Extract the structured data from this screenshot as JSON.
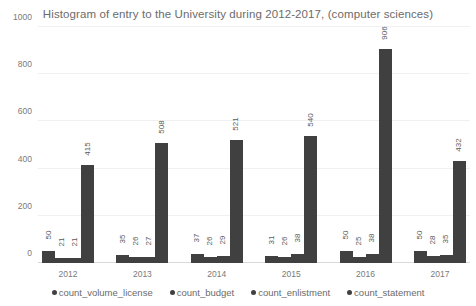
{
  "chart_data": {
    "type": "bar",
    "title": "Histogram of entry to the University during 2012-2017, (computer sciences)",
    "xlabel": "",
    "ylabel": "",
    "ylim": [
      0,
      1000
    ],
    "yticks": [
      0,
      200,
      400,
      600,
      800,
      1000
    ],
    "grid": true,
    "legend_position": "bottom",
    "categories": [
      "2012",
      "2013",
      "2014",
      "2015",
      "2016",
      "2017"
    ],
    "series": [
      {
        "name": "count_volume_license",
        "color": "#404040",
        "values": [
          50,
          35,
          37,
          31,
          50,
          50
        ]
      },
      {
        "name": "count_budget",
        "color": "#404040",
        "values": [
          21,
          26,
          26,
          26,
          25,
          28
        ]
      },
      {
        "name": "count_enlistment",
        "color": "#404040",
        "values": [
          21,
          27,
          29,
          38,
          38,
          35
        ]
      },
      {
        "name": "count_statement",
        "color": "#404040",
        "values": [
          415,
          508,
          521,
          540,
          906,
          432
        ]
      }
    ]
  },
  "legend": {
    "items": [
      {
        "label": "count_volume_license"
      },
      {
        "label": "count_budget"
      },
      {
        "label": "count_enlistment"
      },
      {
        "label": "count_statement"
      }
    ]
  }
}
